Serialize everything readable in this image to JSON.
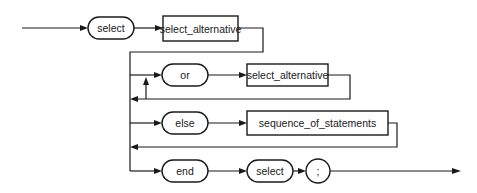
{
  "diagram": {
    "type": "syntax-diagram",
    "nodes": {
      "kw_select": "select",
      "select_alternative_1": "select_alternative",
      "kw_or": "or",
      "select_alternative_2": "select_alternative",
      "kw_else": "else",
      "sequence_of_statements": "sequence_of_statements",
      "kw_end": "end",
      "kw_select_end": "select",
      "semicolon": ";"
    },
    "colors": {
      "stroke": "#1a1a1a",
      "background": "#ffffff"
    }
  }
}
